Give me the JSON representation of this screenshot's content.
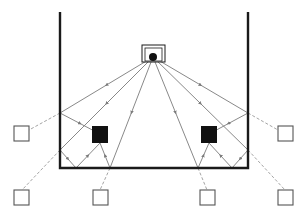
{
  "diagram": {
    "type": "ray-tracing / multipath reflection diagram",
    "colors": {
      "wall": "#1a1a1a",
      "ray": "#7a7a7a",
      "dashed": "#9a9a9a",
      "obstacle": "#111111",
      "virtual_node_stroke": "#555555",
      "background": "#ffffff"
    },
    "room": {
      "left_wall": {
        "x": 60,
        "y1": 12,
        "y2": 168
      },
      "right_wall": {
        "x": 248,
        "y1": 12,
        "y2": 168
      },
      "floor": {
        "y": 168,
        "x1": 60,
        "x2": 248
      }
    },
    "source": {
      "label": "transmitter",
      "box": {
        "x": 142,
        "y": 45,
        "w": 23,
        "h": 17
      },
      "inner_box": {
        "x": 145,
        "y": 48,
        "w": 17,
        "h": 13
      },
      "dot": {
        "cx": 153,
        "cy": 57,
        "r": 4
      }
    },
    "obstacles": [
      {
        "name": "obstacle-left",
        "x": 92,
        "y": 126,
        "w": 16,
        "h": 17
      },
      {
        "name": "obstacle-right",
        "x": 201,
        "y": 126,
        "w": 16,
        "h": 17
      }
    ],
    "virtual_nodes": [
      {
        "name": "virtual-node-left-wall-upper",
        "x": 14,
        "y": 126,
        "w": 15,
        "h": 15
      },
      {
        "name": "virtual-node-right-wall-upper",
        "x": 278,
        "y": 126,
        "w": 15,
        "h": 15
      },
      {
        "name": "virtual-node-bottom-far-left",
        "x": 14,
        "y": 190,
        "w": 15,
        "h": 15
      },
      {
        "name": "virtual-node-bottom-mid-left",
        "x": 93,
        "y": 190,
        "w": 15,
        "h": 15
      },
      {
        "name": "virtual-node-bottom-mid-right",
        "x": 200,
        "y": 190,
        "w": 15,
        "h": 15
      },
      {
        "name": "virtual-node-bottom-far-right",
        "x": 278,
        "y": 190,
        "w": 15,
        "h": 15
      }
    ],
    "rays": [
      {
        "from": [
          153,
          57
        ],
        "to": [
          60,
          113
        ]
      },
      {
        "from": [
          60,
          113
        ],
        "to": [
          100,
          134
        ]
      },
      {
        "from": [
          153,
          57
        ],
        "to": [
          60,
          150
        ]
      },
      {
        "from": [
          60,
          150
        ],
        "to": [
          76,
          168
        ]
      },
      {
        "from": [
          76,
          168
        ],
        "to": [
          100,
          143
        ]
      },
      {
        "from": [
          153,
          57
        ],
        "to": [
          110,
          168
        ]
      },
      {
        "from": [
          110,
          168
        ],
        "to": [
          100,
          143
        ]
      },
      {
        "from": [
          153,
          57
        ],
        "to": [
          248,
          113
        ]
      },
      {
        "from": [
          248,
          113
        ],
        "to": [
          209,
          134
        ]
      },
      {
        "from": [
          153,
          57
        ],
        "to": [
          248,
          150
        ]
      },
      {
        "from": [
          248,
          150
        ],
        "to": [
          232,
          168
        ]
      },
      {
        "from": [
          232,
          168
        ],
        "to": [
          209,
          143
        ]
      },
      {
        "from": [
          153,
          57
        ],
        "to": [
          198,
          168
        ]
      },
      {
        "from": [
          198,
          168
        ],
        "to": [
          209,
          143
        ]
      }
    ],
    "dashed_lines": [
      {
        "from": [
          60,
          113
        ],
        "to": [
          29,
          130
        ]
      },
      {
        "from": [
          248,
          113
        ],
        "to": [
          278,
          130
        ]
      },
      {
        "from": [
          60,
          150
        ],
        "to": [
          22,
          190
        ]
      },
      {
        "from": [
          110,
          168
        ],
        "to": [
          100,
          190
        ]
      },
      {
        "from": [
          198,
          168
        ],
        "to": [
          207,
          190
        ]
      },
      {
        "from": [
          248,
          150
        ],
        "to": [
          285,
          190
        ]
      }
    ]
  }
}
